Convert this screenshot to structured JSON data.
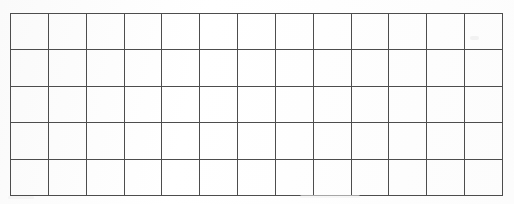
{
  "document": {
    "type": "blank-grid-table",
    "description": "Scanned blank grid / table with empty cells",
    "background_color": "#fdfdfd",
    "line_color": "#4d4d4d",
    "line_width_px": 1
  },
  "grid": {
    "columns": 13,
    "rows": 5,
    "left_px": 10,
    "top_px": 13,
    "width_px": 493,
    "height_px": 177,
    "column_width_px": 37.5,
    "row_height_px": 35.4,
    "cell_text": [
      [
        "",
        "",
        "",
        "",
        "",
        "",
        "",
        "",
        "",
        "",
        "",
        "",
        ""
      ],
      [
        "",
        "",
        "",
        "",
        "",
        "",
        "",
        "",
        "",
        "",
        "",
        "",
        ""
      ],
      [
        "",
        "",
        "",
        "",
        "",
        "",
        "",
        "",
        "",
        "",
        "",
        "",
        ""
      ],
      [
        "",
        "",
        "",
        "",
        "",
        "",
        "",
        "",
        "",
        "",
        "",
        "",
        ""
      ],
      [
        "",
        "",
        "",
        "",
        "",
        "",
        "",
        "",
        "",
        "",
        "",
        "",
        ""
      ]
    ]
  },
  "artifacts": {
    "smudge_top_right": "",
    "smudge_bottom_left": "",
    "smudge_bottom_right": ""
  }
}
